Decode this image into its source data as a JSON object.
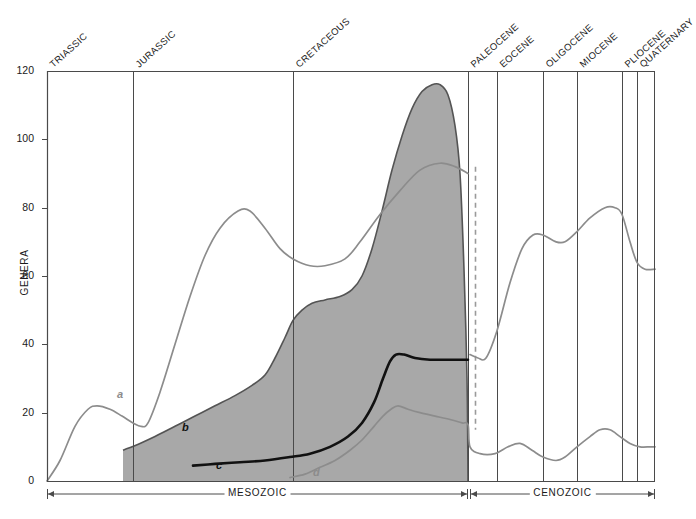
{
  "chart_data": {
    "type": "area",
    "title": "",
    "xlabel": "",
    "ylabel": "GENERA",
    "ylim": [
      0,
      120
    ],
    "yticks": [
      0,
      20,
      40,
      60,
      80,
      100,
      120
    ],
    "grid": false,
    "legend_position": "inline-curve-labels",
    "x_axis_kind": "geologic-time",
    "geologic_periods": [
      {
        "name": "TRIASSIC",
        "x_start_px": 47,
        "x_end_px": 133
      },
      {
        "name": "JURASSIC",
        "x_start_px": 133,
        "x_end_px": 293
      },
      {
        "name": "CRETACEOUS",
        "x_start_px": 293,
        "x_end_px": 468
      },
      {
        "name": "PALEOCENE",
        "x_start_px": 468,
        "x_end_px": 497
      },
      {
        "name": "EOCENE",
        "x_start_px": 497,
        "x_end_px": 543
      },
      {
        "name": "OLIGOCENE",
        "x_start_px": 543,
        "x_end_px": 577
      },
      {
        "name": "MIOCENE",
        "x_start_px": 577,
        "x_end_px": 622
      },
      {
        "name": "PLIOCENE",
        "x_start_px": 622,
        "x_end_px": 637
      },
      {
        "name": "QUATERNARY",
        "x_start_px": 637,
        "x_end_px": 655
      }
    ],
    "eras": [
      {
        "name": "MESOZOIC",
        "x_start_px": 47,
        "x_end_px": 468
      },
      {
        "name": "CENOZOIC",
        "x_start_px": 470,
        "x_end_px": 655
      }
    ],
    "boundary_marker": {
      "name": "K-Pg boundary",
      "style": "dashed",
      "color": "#9a9a9a",
      "x_px": 475
    },
    "series": [
      {
        "name": "a",
        "label": "a",
        "style": "line",
        "color": "#8c8c8c",
        "label_x_px": 117,
        "label_y_px": 388,
        "points": [
          [
            47,
            0
          ],
          [
            60,
            6
          ],
          [
            75,
            16
          ],
          [
            88,
            21
          ],
          [
            97,
            22
          ],
          [
            110,
            21
          ],
          [
            122,
            19
          ],
          [
            133,
            17
          ],
          [
            141,
            16
          ],
          [
            148,
            17
          ],
          [
            160,
            26
          ],
          [
            175,
            40
          ],
          [
            190,
            54
          ],
          [
            205,
            66
          ],
          [
            220,
            74
          ],
          [
            238,
            79
          ],
          [
            250,
            79
          ],
          [
            265,
            74
          ],
          [
            280,
            68
          ],
          [
            293,
            65
          ],
          [
            310,
            63
          ],
          [
            325,
            63
          ],
          [
            345,
            65
          ],
          [
            360,
            70
          ],
          [
            380,
            78
          ],
          [
            400,
            85
          ],
          [
            420,
            91
          ],
          [
            440,
            93
          ],
          [
            455,
            92
          ],
          [
            468,
            90
          ],
          [
            470,
            37
          ],
          [
            478,
            36
          ],
          [
            486,
            36
          ],
          [
            497,
            44
          ],
          [
            510,
            58
          ],
          [
            522,
            68
          ],
          [
            533,
            72
          ],
          [
            543,
            72
          ],
          [
            556,
            70
          ],
          [
            565,
            70
          ],
          [
            577,
            73
          ],
          [
            590,
            77
          ],
          [
            605,
            80
          ],
          [
            615,
            80
          ],
          [
            622,
            78
          ],
          [
            630,
            70
          ],
          [
            637,
            64
          ],
          [
            645,
            62
          ],
          [
            655,
            62
          ]
        ]
      },
      {
        "name": "b",
        "label": "b",
        "style": "area-upper-boundary",
        "color": "#545454",
        "fill": "#a8a8a8",
        "label_x_px": 182,
        "label_y_px": 421,
        "points": [
          [
            123,
            9
          ],
          [
            140,
            11
          ],
          [
            155,
            13
          ],
          [
            175,
            16
          ],
          [
            195,
            19
          ],
          [
            215,
            22
          ],
          [
            235,
            25
          ],
          [
            252,
            28
          ],
          [
            265,
            31
          ],
          [
            275,
            36
          ],
          [
            285,
            42
          ],
          [
            293,
            47
          ],
          [
            302,
            50
          ],
          [
            312,
            52
          ],
          [
            325,
            53
          ],
          [
            340,
            54
          ],
          [
            352,
            56
          ],
          [
            362,
            60
          ],
          [
            372,
            68
          ],
          [
            382,
            79
          ],
          [
            392,
            91
          ],
          [
            402,
            101
          ],
          [
            412,
            109
          ],
          [
            422,
            114
          ],
          [
            432,
            116
          ],
          [
            440,
            116
          ],
          [
            448,
            113
          ],
          [
            455,
            104
          ],
          [
            460,
            90
          ],
          [
            464,
            62
          ],
          [
            467,
            30
          ],
          [
            468,
            0
          ]
        ]
      },
      {
        "name": "c",
        "label": "c",
        "style": "line-bold",
        "color": "#111111",
        "label_x_px": 216,
        "label_y_px": 459,
        "points": [
          [
            193,
            4.5
          ],
          [
            215,
            5
          ],
          [
            240,
            5.5
          ],
          [
            265,
            6
          ],
          [
            290,
            7
          ],
          [
            310,
            8
          ],
          [
            330,
            10
          ],
          [
            348,
            13
          ],
          [
            362,
            17
          ],
          [
            374,
            23
          ],
          [
            383,
            30
          ],
          [
            390,
            35
          ],
          [
            396,
            37
          ],
          [
            404,
            37
          ],
          [
            415,
            36
          ],
          [
            430,
            35.5
          ],
          [
            445,
            35.5
          ],
          [
            460,
            35.5
          ],
          [
            468,
            35.5
          ]
        ]
      },
      {
        "name": "d",
        "label": "d",
        "style": "line",
        "color": "#8c8c8c",
        "label_x_px": 313,
        "label_y_px": 466,
        "points": [
          [
            290,
            1
          ],
          [
            305,
            2
          ],
          [
            320,
            4
          ],
          [
            335,
            6
          ],
          [
            350,
            9
          ],
          [
            362,
            12
          ],
          [
            374,
            16
          ],
          [
            383,
            19
          ],
          [
            391,
            21
          ],
          [
            398,
            22
          ],
          [
            408,
            21
          ],
          [
            420,
            20
          ],
          [
            435,
            19
          ],
          [
            450,
            18
          ],
          [
            462,
            17
          ],
          [
            468,
            16.5
          ],
          [
            470,
            10
          ],
          [
            480,
            8
          ],
          [
            495,
            8
          ],
          [
            508,
            10
          ],
          [
            520,
            11
          ],
          [
            532,
            9
          ],
          [
            543,
            7
          ],
          [
            556,
            6
          ],
          [
            565,
            7
          ],
          [
            577,
            10
          ],
          [
            590,
            13
          ],
          [
            600,
            15
          ],
          [
            610,
            15
          ],
          [
            620,
            13
          ],
          [
            630,
            11
          ],
          [
            640,
            10
          ],
          [
            650,
            10
          ],
          [
            655,
            10
          ]
        ]
      }
    ]
  },
  "axis": {
    "y_title": "GENERA",
    "y_tick_labels": [
      "0",
      "20",
      "40",
      "60",
      "80",
      "100",
      "120"
    ]
  },
  "colors": {
    "shaded_area_fill": "#a8a8a8",
    "shaded_area_stroke": "#545454",
    "gray_curve": "#8c8c8c",
    "black_curve": "#111111",
    "axis": "#4a4a4a",
    "divider": "#4a4a4a",
    "boundary_dash": "#9a9a9a",
    "background": "#ffffff"
  }
}
